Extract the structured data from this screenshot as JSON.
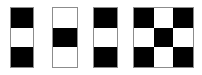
{
  "image": {
    "title": "Checkerboard pattern figures",
    "background_color": "#ffffff",
    "outline_color": "#8c8c8c",
    "black_color": "#000000",
    "white_color": "#ffffff",
    "width": 202,
    "height": 75
  },
  "figures": [
    {
      "name": "figure-1",
      "label": "1x3 vertical strip",
      "rows": 3,
      "cols": 1,
      "x": 10,
      "y": 7,
      "width": 24,
      "height": 61,
      "cells": [
        [
          "black"
        ],
        [
          "white"
        ],
        [
          "black"
        ]
      ]
    },
    {
      "name": "figure-2",
      "label": "1x3 vertical strip inverted",
      "rows": 3,
      "cols": 1,
      "x": 52,
      "y": 7,
      "width": 26,
      "height": 61,
      "cells": [
        [
          "white"
        ],
        [
          "black"
        ],
        [
          "white"
        ]
      ]
    },
    {
      "name": "figure-3",
      "label": "1x3 vertical strip",
      "rows": 3,
      "cols": 1,
      "x": 93,
      "y": 7,
      "width": 25,
      "height": 61,
      "cells": [
        [
          "black"
        ],
        [
          "white"
        ],
        [
          "black"
        ]
      ]
    },
    {
      "name": "figure-4",
      "label": "3x3 checkerboard",
      "rows": 3,
      "cols": 3,
      "x": 133,
      "y": 7,
      "width": 61,
      "height": 61,
      "cells": [
        [
          "black",
          "white",
          "black"
        ],
        [
          "white",
          "black",
          "white"
        ],
        [
          "black",
          "white",
          "black"
        ]
      ]
    }
  ]
}
